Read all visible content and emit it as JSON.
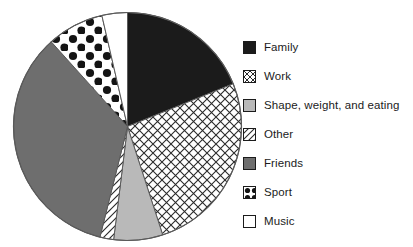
{
  "chart_data": {
    "type": "pie",
    "title": "",
    "subtitle": "",
    "xlabel": "",
    "ylabel": "",
    "grid": false,
    "legend_position": "right",
    "start_angle_deg": 0,
    "direction": "clockwise",
    "center": {
      "x": 127.5,
      "y": 126.5
    },
    "radius": 114,
    "categories": [
      "Family",
      "Work",
      "Shape, weight, and eating",
      "Other",
      "Friends",
      "Sport",
      "Music"
    ],
    "values": [
      18.9,
      26.1,
      6.9,
      1.9,
      34.5,
      8.1,
      3.6
    ],
    "angles_deg": [
      68,
      94,
      25,
      7,
      124,
      29,
      13
    ],
    "slices": [
      {
        "label": "Family",
        "value": 18.9,
        "angle_deg": 68,
        "start_deg": 0,
        "end_deg": 68,
        "pattern": "solid-black",
        "fill": "#1b1b1b"
      },
      {
        "label": "Work",
        "value": 26.1,
        "angle_deg": 94,
        "start_deg": 68,
        "end_deg": 162,
        "pattern": "cross-hatch",
        "fill": "#ffffff"
      },
      {
        "label": "Shape, weight, and eating",
        "value": 6.9,
        "angle_deg": 25,
        "start_deg": 162,
        "end_deg": 187,
        "pattern": "solid-light-gray",
        "fill": "#b9b9b9"
      },
      {
        "label": "Other",
        "value": 1.9,
        "angle_deg": 7,
        "start_deg": 187,
        "end_deg": 194,
        "pattern": "diagonal-lines",
        "fill": "#ffffff"
      },
      {
        "label": "Friends",
        "value": 34.5,
        "angle_deg": 124,
        "start_deg": 194,
        "end_deg": 318,
        "pattern": "solid-dark-gray",
        "fill": "#6e6e6e"
      },
      {
        "label": "Sport",
        "value": 8.1,
        "angle_deg": 29,
        "start_deg": 318,
        "end_deg": 347,
        "pattern": "polka-dots",
        "fill": "#ffffff"
      },
      {
        "label": "Music",
        "value": 3.6,
        "angle_deg": 13,
        "start_deg": 347,
        "end_deg": 360,
        "pattern": "solid-white",
        "fill": "#ffffff"
      }
    ]
  },
  "legend": {
    "items": [
      {
        "label": "Family",
        "pattern": "solid-black"
      },
      {
        "label": "Work",
        "pattern": "cross-hatch"
      },
      {
        "label": "Shape, weight, and eating",
        "pattern": "solid-light-gray"
      },
      {
        "label": "Other",
        "pattern": "diagonal-lines"
      },
      {
        "label": "Friends",
        "pattern": "solid-dark-gray"
      },
      {
        "label": "Sport",
        "pattern": "polka-dots"
      },
      {
        "label": "Music",
        "pattern": "solid-white"
      }
    ]
  },
  "colors": {
    "outline": "#5a5a5a",
    "black": "#1b1b1b",
    "dark_gray": "#6e6e6e",
    "light_gray": "#b9b9b9",
    "white": "#ffffff",
    "text": "#1b1b1b"
  }
}
